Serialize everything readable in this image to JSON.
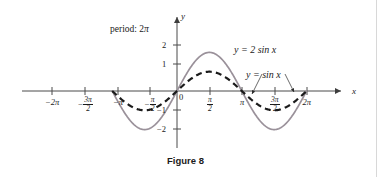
{
  "figure": {
    "caption": "Figure 8",
    "caption_x": 167,
    "caption_y": 155,
    "background": "#ffffff"
  },
  "annotations": {
    "period": {
      "prefix": "period: 2",
      "symbol": "π",
      "x": 110,
      "y": 25
    },
    "curve_label_1": {
      "text": "y = 2 sin x",
      "x": 234,
      "y": 45,
      "color": "#2b2b2b"
    },
    "curve_label_2": {
      "text": "y = sin x",
      "x": 246,
      "y": 70,
      "color": "#2b2b2b"
    }
  },
  "axes": {
    "x_axis_name": "x",
    "y_axis_name": "y",
    "x_axis_name_x": 352,
    "x_axis_name_y": 87,
    "y_axis_name_x": 181,
    "y_axis_name_y": 12,
    "origin_label": "0",
    "origin_label_x": 179,
    "origin_label_y": 93,
    "axis_color": "#4a4a4a",
    "x_ticks": [
      {
        "label": "−2π",
        "value": -6.283185,
        "px": 52,
        "kind": "plain"
      },
      {
        "label": "−3π/2",
        "value": -4.712389,
        "px": 85,
        "kind": "fraction",
        "sign": "−",
        "num": "3π",
        "den": "2"
      },
      {
        "label": "−π",
        "value": -3.141593,
        "px": 118,
        "kind": "plain"
      },
      {
        "label": "−π/2",
        "value": -1.570796,
        "px": 150,
        "kind": "fraction",
        "sign": "−",
        "num": "π",
        "den": "2"
      },
      {
        "label": "π/2",
        "value": 1.570796,
        "px": 210,
        "kind": "fraction",
        "sign": "",
        "num": "π",
        "den": "2"
      },
      {
        "label": "π",
        "value": 3.141593,
        "px": 242,
        "kind": "plain"
      },
      {
        "label": "3π/2",
        "value": 4.712389,
        "px": 275,
        "kind": "fraction",
        "sign": "",
        "num": "3π",
        "den": "2"
      },
      {
        "label": "2π",
        "value": 6.283185,
        "px": 307,
        "kind": "plain"
      }
    ],
    "y_ticks": [
      {
        "label": "2",
        "value": 2,
        "px": 45
      },
      {
        "label": "1",
        "value": 1,
        "px": 64
      },
      {
        "label": "−1",
        "value": -1,
        "px": 110
      },
      {
        "label": "−2",
        "value": -2,
        "px": 129
      }
    ]
  },
  "chart_data": {
    "type": "line",
    "title": "Figure 8",
    "xlabel": "x",
    "ylabel": "y",
    "xlim": [
      -7.33,
      7.07
    ],
    "ylim": [
      -2.6,
      2.6
    ],
    "grid": false,
    "legend": "inline-labels",
    "annotations": [
      "period: 2π"
    ],
    "x_tick_values": [
      -6.283185,
      -4.712389,
      -3.141593,
      -1.570796,
      1.570796,
      3.141593,
      4.712389,
      6.283185
    ],
    "x_tick_labels": [
      "−2π",
      "−3π/2",
      "−π",
      "−π/2",
      "π/2",
      "π",
      "3π/2",
      "2π"
    ],
    "y_tick_values": [
      2,
      1,
      -1,
      -2
    ],
    "y_tick_labels": [
      "2",
      "1",
      "−1",
      "−2"
    ],
    "series": [
      {
        "name": "y = 2 sin x",
        "expression": "2*sin(x)",
        "amplitude": 2,
        "period": 6.283185,
        "style": "solid",
        "color": "#9a919a",
        "width": 1.7,
        "domain": [
          -3.141593,
          6.283185
        ],
        "sample_points": [
          {
            "x": -3.141593,
            "y": 0
          },
          {
            "x": -2.356194,
            "y": -1.414
          },
          {
            "x": -1.570796,
            "y": -2
          },
          {
            "x": -0.785398,
            "y": -1.414
          },
          {
            "x": 0,
            "y": 0
          },
          {
            "x": 0.785398,
            "y": 1.414
          },
          {
            "x": 1.570796,
            "y": 2
          },
          {
            "x": 2.356194,
            "y": 1.414
          },
          {
            "x": 3.141593,
            "y": 0
          },
          {
            "x": 3.926991,
            "y": -1.414
          },
          {
            "x": 4.712389,
            "y": -2
          },
          {
            "x": 5.497787,
            "y": -1.414
          },
          {
            "x": 6.283185,
            "y": 0
          }
        ]
      },
      {
        "name": "y = sin x",
        "expression": "sin(x)",
        "amplitude": 1,
        "period": 6.283185,
        "style": "dashed",
        "color": "#1b1b1b",
        "width": 2.2,
        "domain": [
          -3.141593,
          6.283185
        ],
        "sample_points": [
          {
            "x": -3.141593,
            "y": 0
          },
          {
            "x": -2.356194,
            "y": -0.707
          },
          {
            "x": -1.570796,
            "y": -1
          },
          {
            "x": -0.785398,
            "y": -0.707
          },
          {
            "x": 0,
            "y": 0
          },
          {
            "x": 0.785398,
            "y": 0.707
          },
          {
            "x": 1.570796,
            "y": 1
          },
          {
            "x": 2.356194,
            "y": 0.707
          },
          {
            "x": 3.141593,
            "y": 0
          },
          {
            "x": 3.926991,
            "y": -0.707
          },
          {
            "x": 4.712389,
            "y": -1
          },
          {
            "x": 5.497787,
            "y": -0.707
          },
          {
            "x": 6.283185,
            "y": 0
          }
        ]
      }
    ],
    "leader_lines": [
      {
        "from_x": 262,
        "from_y": 74,
        "to_x": 252,
        "to_y": 94,
        "target": "y = sin x left branch"
      },
      {
        "from_x": 285,
        "from_y": 74,
        "to_x": 294,
        "to_y": 92,
        "target": "y = sin x right branch"
      }
    ]
  },
  "geometry": {
    "origin_px_x": 177,
    "origin_px_y": 91,
    "px_per_half_pi": 32.4,
    "px_per_unit_y": 19.3,
    "x_axis_left": 22,
    "x_axis_right": 345,
    "y_axis_top": 14,
    "y_axis_bottom": 148
  }
}
